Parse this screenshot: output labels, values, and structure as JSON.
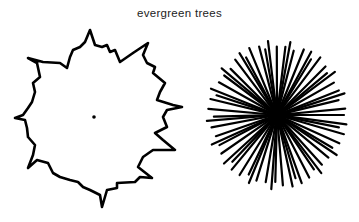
{
  "title": "evergreen trees",
  "figures": [
    {
      "name": "crown-outline-view",
      "description": "irregular spiky outline with center dot"
    },
    {
      "name": "radiating-branches-view",
      "description": "dense starburst of radiating lines"
    }
  ],
  "colors": {
    "ink": "#000000",
    "background": "#ffffff",
    "title": "#222222"
  }
}
